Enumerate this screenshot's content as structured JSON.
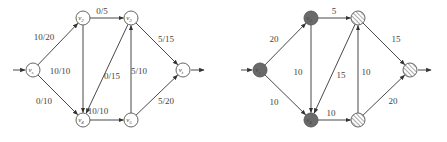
{
  "colors": {
    "edge": "#333333",
    "label": "#444444",
    "node_stroke": "#555555",
    "node_fill_plain": "#ffffff",
    "node_fill_dark": "#6a6a6a",
    "hatch": "#555555"
  },
  "graphs": [
    {
      "name": "flow-network",
      "offset_x": 0,
      "nodes": [
        {
          "id": "vs",
          "label": "vs",
          "x": 33,
          "y": 70,
          "style": "plain"
        },
        {
          "id": "v2",
          "label": "v2",
          "x": 83,
          "y": 18,
          "style": "plain"
        },
        {
          "id": "v3",
          "label": "v3",
          "x": 131,
          "y": 18,
          "style": "plain"
        },
        {
          "id": "v4",
          "label": "v4",
          "x": 83,
          "y": 120,
          "style": "plain"
        },
        {
          "id": "v5",
          "label": "v5",
          "x": 131,
          "y": 120,
          "style": "plain"
        },
        {
          "id": "vt",
          "label": "vt",
          "x": 183,
          "y": 70,
          "style": "plain"
        }
      ],
      "edges": [
        {
          "from": "vs",
          "to": "v2",
          "label": "10/20",
          "lx": 44,
          "ly": 40
        },
        {
          "from": "vs",
          "to": "v4",
          "label": "0/10",
          "lx": 44,
          "ly": 104
        },
        {
          "from": "v2",
          "to": "v3",
          "label": "0/5",
          "lx": 102,
          "ly": 14
        },
        {
          "from": "v2",
          "to": "v4",
          "label": "10/10",
          "lx": 60,
          "ly": 74
        },
        {
          "from": "v3",
          "to": "v4",
          "label": "0/15",
          "lx": 112,
          "ly": 79
        },
        {
          "from": "v5",
          "to": "v3",
          "label": "5/10",
          "lx": 139,
          "ly": 74
        },
        {
          "from": "v3",
          "to": "vt",
          "label": "5/15",
          "lx": 166,
          "ly": 42
        },
        {
          "from": "v4",
          "to": "v5",
          "label": "10/10",
          "lx": 98,
          "ly": 114
        },
        {
          "from": "v5",
          "to": "vt",
          "label": "5/20",
          "lx": 166,
          "ly": 104
        }
      ],
      "source_arrow": {
        "x1": 13,
        "x2": 25,
        "y": 70
      },
      "sink_arrow": {
        "x1": 191,
        "x2": 204,
        "y": 70
      }
    },
    {
      "name": "residual-cut",
      "offset_x": 0,
      "nodes": [
        {
          "id": "vs",
          "label": "vs",
          "x": 260,
          "y": 70,
          "style": "dark"
        },
        {
          "id": "v2",
          "label": "v2",
          "x": 311,
          "y": 18,
          "style": "dark"
        },
        {
          "id": "v3",
          "label": "",
          "x": 358,
          "y": 18,
          "style": "hatched"
        },
        {
          "id": "v4",
          "label": "v4",
          "x": 311,
          "y": 120,
          "style": "dark"
        },
        {
          "id": "v5",
          "label": "",
          "x": 358,
          "y": 120,
          "style": "hatched"
        },
        {
          "id": "vt",
          "label": "",
          "x": 410,
          "y": 70,
          "style": "hatched"
        }
      ],
      "edges": [
        {
          "from": "vs",
          "to": "v2",
          "label": "20",
          "lx": 274,
          "ly": 42
        },
        {
          "from": "vs",
          "to": "v4",
          "label": "10",
          "lx": 274,
          "ly": 105
        },
        {
          "from": "v2",
          "to": "v3",
          "label": "5",
          "lx": 334,
          "ly": 14
        },
        {
          "from": "v2",
          "to": "v4",
          "label": "10",
          "lx": 298,
          "ly": 75
        },
        {
          "from": "v3",
          "to": "v4",
          "label": "15",
          "lx": 341,
          "ly": 78
        },
        {
          "from": "v5",
          "to": "v3",
          "label": "10",
          "lx": 366,
          "ly": 75
        },
        {
          "from": "v3",
          "to": "vt",
          "label": "15",
          "lx": 396,
          "ly": 42
        },
        {
          "from": "v4",
          "to": "v5",
          "label": "10",
          "lx": 331,
          "ly": 116
        },
        {
          "from": "v5",
          "to": "vt",
          "label": "20",
          "lx": 393,
          "ly": 104
        }
      ],
      "source_arrow": {
        "x1": 241,
        "x2": 252,
        "y": 70
      },
      "sink_arrow": {
        "x1": 418,
        "x2": 431,
        "y": 70
      }
    }
  ]
}
